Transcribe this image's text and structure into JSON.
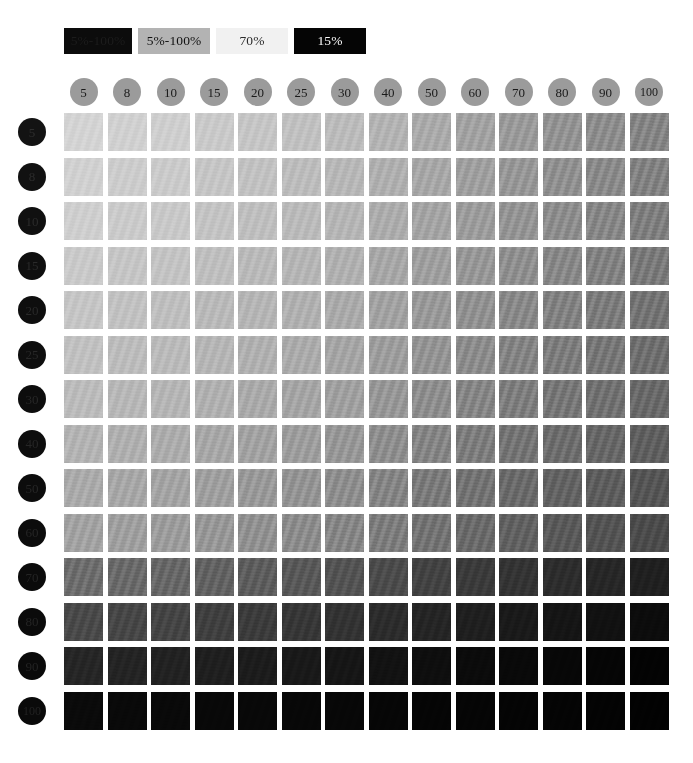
{
  "page": {
    "background": "#ffffff"
  },
  "legend": {
    "items": [
      {
        "label": "5%-100%",
        "swatch_color": "#0c0c0c",
        "text_color": "#1c1c1c"
      },
      {
        "label": "5%-100%",
        "swatch_color": "#b3b3b3",
        "text_color": "#111111"
      },
      {
        "label": "70%",
        "swatch_color": "#f1f1f1",
        "text_color": "#2b2b2b"
      },
      {
        "label": "15%",
        "swatch_color": "#050505",
        "text_color": "#fafafa"
      }
    ]
  },
  "axes": {
    "column_label": "Tint %",
    "row_label": "Tint %",
    "columns": [
      {
        "label": "5",
        "value": 5,
        "circle_color": "#9b9b9b",
        "text_color": "#1a1a1a"
      },
      {
        "label": "8",
        "value": 8,
        "circle_color": "#9b9b9b",
        "text_color": "#1a1a1a"
      },
      {
        "label": "10",
        "value": 10,
        "circle_color": "#9b9b9b",
        "text_color": "#1a1a1a"
      },
      {
        "label": "15",
        "value": 15,
        "circle_color": "#9b9b9b",
        "text_color": "#1a1a1a"
      },
      {
        "label": "20",
        "value": 20,
        "circle_color": "#9b9b9b",
        "text_color": "#1a1a1a"
      },
      {
        "label": "25",
        "value": 25,
        "circle_color": "#9b9b9b",
        "text_color": "#1a1a1a"
      },
      {
        "label": "30",
        "value": 30,
        "circle_color": "#9b9b9b",
        "text_color": "#1a1a1a"
      },
      {
        "label": "40",
        "value": 40,
        "circle_color": "#9b9b9b",
        "text_color": "#1a1a1a"
      },
      {
        "label": "50",
        "value": 50,
        "circle_color": "#9b9b9b",
        "text_color": "#1a1a1a"
      },
      {
        "label": "60",
        "value": 60,
        "circle_color": "#9b9b9b",
        "text_color": "#1a1a1a"
      },
      {
        "label": "70",
        "value": 70,
        "circle_color": "#9b9b9b",
        "text_color": "#1a1a1a"
      },
      {
        "label": "80",
        "value": 80,
        "circle_color": "#9b9b9b",
        "text_color": "#1a1a1a"
      },
      {
        "label": "90",
        "value": 90,
        "circle_color": "#9b9b9b",
        "text_color": "#1a1a1a"
      },
      {
        "label": "100",
        "value": 100,
        "circle_color": "#9b9b9b",
        "text_color": "#1a1a1a"
      }
    ],
    "rows": [
      {
        "label": "5",
        "value": 5,
        "circle_color": "#131313",
        "text_color": "#2e2e2e"
      },
      {
        "label": "8",
        "value": 8,
        "circle_color": "#111111",
        "text_color": "#2c2c2c"
      },
      {
        "label": "10",
        "value": 10,
        "circle_color": "#101010",
        "text_color": "#2b2b2b"
      },
      {
        "label": "15",
        "value": 15,
        "circle_color": "#0f0f0f",
        "text_color": "#2a2a2a"
      },
      {
        "label": "20",
        "value": 20,
        "circle_color": "#0e0e0e",
        "text_color": "#292929"
      },
      {
        "label": "25",
        "value": 25,
        "circle_color": "#0e0e0e",
        "text_color": "#282828"
      },
      {
        "label": "30",
        "value": 30,
        "circle_color": "#0d0d0d",
        "text_color": "#272727"
      },
      {
        "label": "40",
        "value": 40,
        "circle_color": "#0d0d0d",
        "text_color": "#262626"
      },
      {
        "label": "50",
        "value": 50,
        "circle_color": "#0c0c0c",
        "text_color": "#262626"
      },
      {
        "label": "60",
        "value": 60,
        "circle_color": "#0c0c0c",
        "text_color": "#252525"
      },
      {
        "label": "70",
        "value": 70,
        "circle_color": "#0b0b0b",
        "text_color": "#242424"
      },
      {
        "label": "80",
        "value": 80,
        "circle_color": "#0b0b0b",
        "text_color": "#242424"
      },
      {
        "label": "90",
        "value": 90,
        "circle_color": "#0a0a0a",
        "text_color": "#232323"
      },
      {
        "label": "100",
        "value": 100,
        "circle_color": "#0a0a0a",
        "text_color": "#222222"
      }
    ]
  },
  "chart_data": {
    "type": "heatmap",
    "xlabel": "Column tint %",
    "ylabel": "Row tint %",
    "x": [
      5,
      8,
      10,
      15,
      20,
      25,
      30,
      40,
      50,
      60,
      70,
      80,
      90,
      100
    ],
    "y": [
      5,
      8,
      10,
      15,
      20,
      25,
      30,
      40,
      50,
      60,
      70,
      80,
      90,
      100
    ],
    "grid": false,
    "legend_position": "top-left",
    "colormap": "grayscale-inverted",
    "value_unit": "%",
    "note": "Cell value = combined ink coverage of row tint and column tint; rendered as gray level.",
    "values": [
      [
        12,
        14,
        15,
        18,
        20,
        23,
        26,
        30,
        34,
        38,
        42,
        45,
        48,
        52
      ],
      [
        14,
        16,
        17,
        20,
        22,
        25,
        28,
        32,
        36,
        40,
        44,
        47,
        50,
        54
      ],
      [
        15,
        17,
        18,
        21,
        24,
        26,
        29,
        34,
        38,
        42,
        45,
        49,
        52,
        55
      ],
      [
        18,
        20,
        21,
        24,
        27,
        29,
        32,
        37,
        41,
        45,
        48,
        52,
        55,
        58
      ],
      [
        20,
        22,
        24,
        27,
        29,
        32,
        35,
        39,
        44,
        48,
        51,
        55,
        58,
        61
      ],
      [
        23,
        25,
        26,
        29,
        32,
        35,
        38,
        42,
        47,
        51,
        54,
        58,
        61,
        64
      ],
      [
        26,
        28,
        29,
        32,
        35,
        38,
        41,
        45,
        50,
        54,
        57,
        61,
        64,
        67
      ],
      [
        30,
        32,
        34,
        37,
        39,
        42,
        45,
        50,
        54,
        58,
        62,
        65,
        68,
        71
      ],
      [
        34,
        36,
        38,
        41,
        44,
        47,
        50,
        54,
        59,
        63,
        66,
        70,
        73,
        76
      ],
      [
        38,
        40,
        42,
        45,
        48,
        51,
        54,
        58,
        63,
        67,
        71,
        74,
        77,
        80
      ],
      [
        42,
        44,
        45,
        48,
        51,
        54,
        57,
        62,
        66,
        71,
        74,
        78,
        81,
        84
      ],
      [
        45,
        47,
        49,
        52,
        55,
        58,
        61,
        65,
        70,
        74,
        78,
        81,
        85,
        88
      ],
      [
        48,
        50,
        52,
        55,
        58,
        61,
        64,
        68,
        73,
        77,
        81,
        85,
        88,
        92
      ],
      [
        52,
        54,
        55,
        58,
        61,
        64,
        67,
        71,
        76,
        80,
        84,
        88,
        92,
        96
      ]
    ],
    "cell_colors": [
      [
        "#d4d4d4",
        "#d1d1d1",
        "#cfcfcf",
        "#cacaca",
        "#c6c6c6",
        "#c1c1c1",
        "#bcbcbc",
        "#b4b4b4",
        "#ababab",
        "#a3a3a3",
        "#9b9b9b",
        "#949494",
        "#8e8e8e",
        "#868686"
      ],
      [
        "#d1d1d1",
        "#cdcdcd",
        "#cbcbcb",
        "#c6c6c6",
        "#c2c2c2",
        "#bdbdbd",
        "#b8b8b8",
        "#b0b0b0",
        "#a8a8a8",
        "#a0a0a0",
        "#989898",
        "#919191",
        "#8b8b8b",
        "#838383"
      ],
      [
        "#cfcfcf",
        "#cbcbcb",
        "#c9c9c9",
        "#c4c4c4",
        "#bfbfbf",
        "#bbbbbb",
        "#b6b6b6",
        "#adadad",
        "#a5a5a5",
        "#9d9d9d",
        "#959595",
        "#8e8e8e",
        "#888888",
        "#808080"
      ],
      [
        "#cacaca",
        "#c6c6c6",
        "#c4c4c4",
        "#bfbfbf",
        "#bababa",
        "#b6b6b6",
        "#b1b1b1",
        "#a8a8a8",
        "#a0a0a0",
        "#989898",
        "#909090",
        "#898989",
        "#838383",
        "#7b7b7b"
      ],
      [
        "#c6c6c6",
        "#c2c2c2",
        "#bfbfbf",
        "#bababa",
        "#b6b6b6",
        "#b1b1b1",
        "#ababab",
        "#a3a3a3",
        "#9a9a9a",
        "#929292",
        "#8a8a8a",
        "#838383",
        "#7d7d7d",
        "#757575"
      ],
      [
        "#c1c1c1",
        "#bdbdbd",
        "#bbbbbb",
        "#b6b6b6",
        "#b1b1b1",
        "#acacac",
        "#a6a6a6",
        "#9e9e9e",
        "#959595",
        "#8d8d8d",
        "#858585",
        "#7e7e7e",
        "#787878",
        "#707070"
      ],
      [
        "#bcbcbc",
        "#b8b8b8",
        "#b6b6b6",
        "#b1b1b1",
        "#ababab",
        "#a6a6a6",
        "#a1a1a1",
        "#989898",
        "#8f8f8f",
        "#878787",
        "#7f7f7f",
        "#787878",
        "#727272",
        "#6a6a6a"
      ],
      [
        "#b4b4b4",
        "#b0b0b0",
        "#adadad",
        "#a8a8a8",
        "#a3a3a3",
        "#9e9e9e",
        "#989898",
        "#8f8f8f",
        "#868686",
        "#7e7e7e",
        "#757575",
        "#6e6e6e",
        "#686868",
        "#606060"
      ],
      [
        "#ababab",
        "#a8a8a8",
        "#a5a5a5",
        "#a0a0a0",
        "#9a9a9a",
        "#959595",
        "#8f8f8f",
        "#868686",
        "#7c7c7c",
        "#747474",
        "#6b6b6b",
        "#646464",
        "#5e5e5e",
        "#565656"
      ],
      [
        "#a3a3a3",
        "#a0a0a0",
        "#9d9d9d",
        "#989898",
        "#929292",
        "#8d8d8d",
        "#878787",
        "#7e7e7e",
        "#747474",
        "#6b6b6b",
        "#626262",
        "#5a5a5a",
        "#545454",
        "#4c4c4c"
      ],
      [
        "#6e6e6e",
        "#6b6b6b",
        "#686868",
        "#636363",
        "#5e5e5e",
        "#595959",
        "#545454",
        "#4c4c4c",
        "#434343",
        "#3b3b3b",
        "#343434",
        "#2d2d2d",
        "#272727",
        "#202020"
      ],
      [
        "#4a4a4a",
        "#474747",
        "#454545",
        "#404040",
        "#3c3c3c",
        "#373737",
        "#333333",
        "#2c2c2c",
        "#252525",
        "#1f1f1f",
        "#1a1a1a",
        "#151515",
        "#111111",
        "#0c0c0c"
      ],
      [
        "#262626",
        "#242424",
        "#222222",
        "#1f1f1f",
        "#1c1c1c",
        "#191919",
        "#161616",
        "#121212",
        "#0e0e0e",
        "#0b0b0b",
        "#090909",
        "#070707",
        "#050505",
        "#030303"
      ],
      [
        "#0a0a0a",
        "#090909",
        "#090909",
        "#080808",
        "#080808",
        "#070707",
        "#070707",
        "#060606",
        "#050505",
        "#050505",
        "#040404",
        "#040404",
        "#030303",
        "#020202"
      ]
    ]
  },
  "layout": {
    "grid_left": 64,
    "grid_top": 113,
    "cell_w": 39,
    "cell_h": 38,
    "gap_x": 4.5,
    "gap_y": 6.5
  }
}
